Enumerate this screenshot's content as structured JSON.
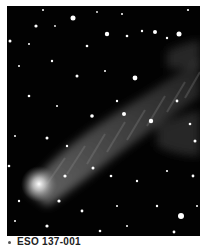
{
  "image": {
    "subject": "galaxy-with-gas-tail-starfield",
    "background_color": "#020202",
    "tail_color": "#6a6a6a",
    "core_color": "#ffffff"
  },
  "caption": {
    "text": "ESO 137-001"
  }
}
